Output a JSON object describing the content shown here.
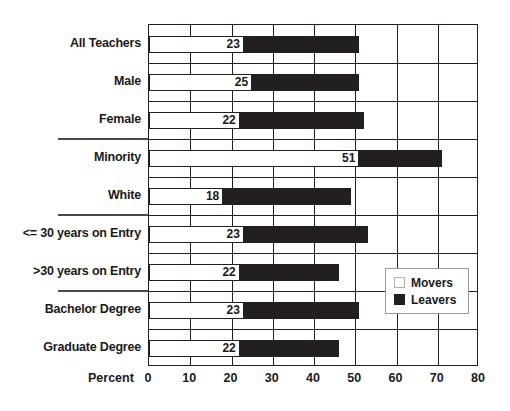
{
  "chart_data": {
    "type": "bar",
    "subtype": "horizontal-stacked",
    "title": "",
    "xlabel": "Percent",
    "ylabel": "",
    "xlim": [
      0,
      80
    ],
    "xticks": [
      0,
      10,
      20,
      30,
      40,
      50,
      60,
      70,
      80
    ],
    "grid": true,
    "legend_position": "inside-right",
    "categories": [
      "All Teachers",
      "Male",
      "Female",
      "Minority",
      "White",
      "<= 30 years on Entry",
      ">30 years on Entry",
      "Bachelor Degree",
      "Graduate Degree"
    ],
    "series": [
      {
        "name": "Movers",
        "color": "#ffffff",
        "values": [
          23,
          25,
          22,
          51,
          18,
          23,
          22,
          23,
          22
        ],
        "labels": [
          "23",
          "25",
          "22",
          "51",
          "18",
          "23",
          "22",
          "23",
          "22"
        ]
      },
      {
        "name": "Leavers",
        "color": "#231f20",
        "values": [
          28,
          26,
          30,
          20,
          31,
          30,
          24,
          28,
          24
        ],
        "labels": [
          "",
          "",
          "",
          "",
          "",
          "",
          "",
          "",
          ""
        ]
      }
    ],
    "cumulative_totals": [
      51,
      51,
      52,
      71,
      49,
      53,
      46,
      51,
      46
    ],
    "group_separators_after": [
      "Female",
      "White",
      ">30 years on Entry"
    ]
  },
  "legend": {
    "items": [
      {
        "label": "Movers",
        "swatch": "white-square-icon"
      },
      {
        "label": "Leavers",
        "swatch": "black-square-icon"
      }
    ]
  },
  "axis": {
    "title": "Percent",
    "tick_labels": [
      "0",
      "10",
      "20",
      "30",
      "40",
      "50",
      "60",
      "70",
      "80"
    ]
  }
}
